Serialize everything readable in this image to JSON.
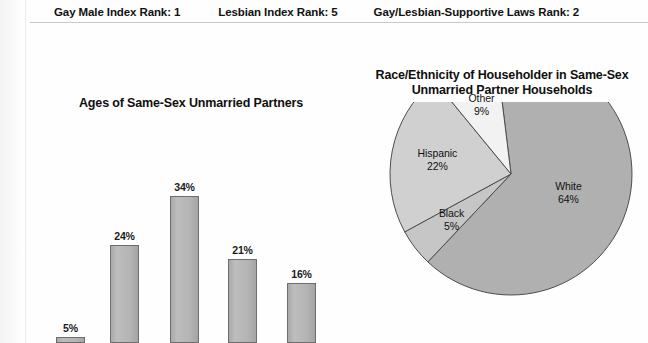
{
  "header": {
    "ranks": [
      "Gay Male Index Rank: 1",
      "Lesbian Index Rank: 5",
      "Gay/Lesbian-Supportive Laws Rank: 2"
    ]
  },
  "chart_data": [
    {
      "type": "bar",
      "title": "Ages of Same-Sex Unmarried Partners",
      "categories": [
        "",
        "",
        "",
        "",
        ""
      ],
      "values": [
        5,
        24,
        34,
        21,
        16
      ],
      "value_labels": [
        "5%",
        "24%",
        "34%",
        "21%",
        "16%"
      ],
      "xlabel": "",
      "ylabel": "",
      "ylim": [
        0,
        40
      ],
      "grid": false,
      "legend": "none",
      "bar_color": "#b2b2b2",
      "bar_border_color": "#6d6d6d"
    },
    {
      "type": "pie",
      "title": "Race/Ethnicity of Householder in Same-Sex Unmarried Partner Households",
      "labels": [
        "White",
        "Black",
        "Hispanic",
        "Other"
      ],
      "values": [
        64,
        5,
        22,
        9
      ],
      "value_labels": [
        "64%",
        "5%",
        "22%",
        "9%"
      ],
      "colors": [
        "#b0b0b0",
        "#c6c6c6",
        "#d0d0d0",
        "#f2f2f2"
      ],
      "slice_border_color": "#4d4d4d",
      "legend": "labels-inside"
    }
  ]
}
